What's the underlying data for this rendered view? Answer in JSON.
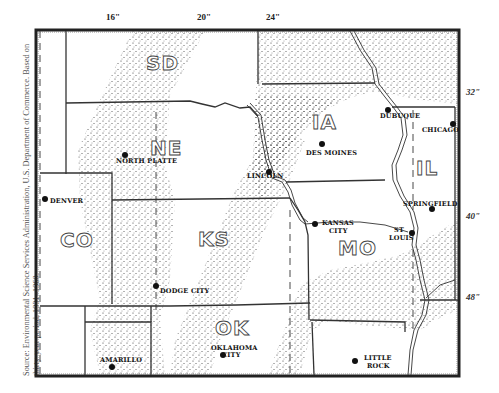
{
  "source_note": "Source: Environmental Science Services Administration, U.S. Department of Commerce. Based on thirty-year period, 1931–1960.",
  "isohyets": {
    "longitude_labels": [
      {
        "label": "16\"",
        "x": 112
      },
      {
        "label": "20\"",
        "x": 204
      },
      {
        "label": "24\"",
        "x": 274
      }
    ],
    "latitude_labels": [
      {
        "label": "32\"",
        "y": 92
      },
      {
        "label": "40\"",
        "y": 216
      },
      {
        "label": "48\"",
        "y": 296
      }
    ]
  },
  "states": [
    {
      "abbr": "SD",
      "x": 152,
      "y": 72
    },
    {
      "abbr": "NE",
      "x": 152,
      "y": 158
    },
    {
      "abbr": "IA",
      "x": 313,
      "y": 132
    },
    {
      "abbr": "IL",
      "x": 421,
      "y": 176
    },
    {
      "abbr": "CO",
      "x": 48,
      "y": 248
    },
    {
      "abbr": "KS",
      "x": 198,
      "y": 248
    },
    {
      "abbr": "MO",
      "x": 338,
      "y": 260
    },
    {
      "abbr": "OK",
      "x": 216,
      "y": 336
    }
  ],
  "cities": [
    {
      "name": "NORTH PLATTE",
      "label_line2": "",
      "dot_x": 125,
      "dot_y": 155,
      "lx": 116,
      "ly": 164
    },
    {
      "name": "LINCOLN",
      "label_line2": "",
      "dot_x": 269,
      "dot_y": 172,
      "lx": 247,
      "ly": 178
    },
    {
      "name": "DES MOINES",
      "label_line2": "",
      "dot_x": 322,
      "dot_y": 144,
      "lx": 306,
      "ly": 155
    },
    {
      "name": "DUBUQUE",
      "label_line2": "",
      "dot_x": 388,
      "dot_y": 110,
      "lx": 379,
      "ly": 118
    },
    {
      "name": "CHICAGO",
      "label_line2": "",
      "dot_x": 453,
      "dot_y": 124,
      "lx": 423,
      "ly": 132
    },
    {
      "name": "DENVER",
      "label_line2": "",
      "dot_x": 45,
      "dot_y": 199,
      "lx": 50,
      "ly": 203
    },
    {
      "name": "SPRINGFIELD",
      "label_line2": "",
      "dot_x": 432,
      "dot_y": 209,
      "lx": 404,
      "ly": 206
    },
    {
      "name": "KANSAS",
      "label_line2": "CITY",
      "dot_x": 315,
      "dot_y": 224,
      "lx": 322,
      "ly": 225
    },
    {
      "name": "ST",
      "label_line2": "LOUIS",
      "dot_x": 412,
      "dot_y": 233,
      "lx": 392,
      "ly": 232
    },
    {
      "name": "DODGE CITY",
      "label_line2": "",
      "dot_x": 156,
      "dot_y": 286,
      "lx": 160,
      "ly": 293
    },
    {
      "name": "AMARILLO",
      "label_line2": "",
      "dot_x": 112,
      "dot_y": 367,
      "lx": 100,
      "ly": 362
    },
    {
      "name": "OKLAHOMA",
      "label_line2": "CITY",
      "dot_x": 223,
      "dot_y": 355,
      "lx": 211,
      "ly": 350
    },
    {
      "name": "LITTLE",
      "label_line2": "ROCK",
      "dot_x": 355,
      "dot_y": 361,
      "lx": 364,
      "ly": 360
    }
  ],
  "colors": {
    "ink": "#222222",
    "stipple": "#333333",
    "paper": "#ffffff"
  }
}
